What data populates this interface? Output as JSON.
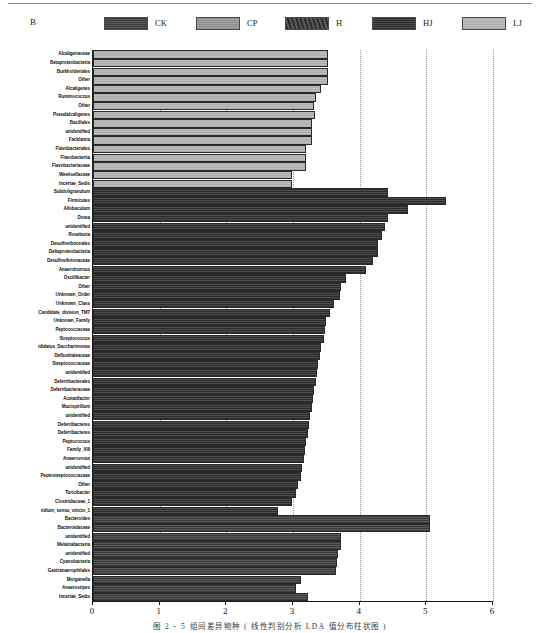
{
  "panel": {
    "label": "B"
  },
  "legend": {
    "items": [
      {
        "label": "CK",
        "group": "CK",
        "color": "#4a4a4a"
      },
      {
        "label": "CP",
        "group": "CP",
        "color": "#9a9a9a"
      },
      {
        "label": "H",
        "group": "H",
        "color": "#3a3a3a"
      },
      {
        "label": "HJ",
        "group": "HJ",
        "color": "#3c3c3c"
      },
      {
        "label": "LJ",
        "group": "LJ",
        "color": "#b5b5b5"
      }
    ]
  },
  "caption": {
    "text": "图 2 - 5    组间差异物种 ( 线性判别分析 LDA 值分布柱状图 )"
  },
  "chart_data": {
    "type": "bar",
    "orientation": "horizontal",
    "title": "",
    "xlabel": "",
    "ylabel": "",
    "xlim": [
      0,
      6
    ],
    "xticks": [
      0,
      1,
      2,
      3,
      4,
      5,
      6
    ],
    "grid": true,
    "legend_position": "top",
    "groups": [
      "CK",
      "CP",
      "H",
      "HJ",
      "LJ"
    ],
    "categories": [
      "Alcaligenaceae",
      "Betaproteobacteria",
      "Burkholderiales",
      "Other",
      "Alcaligenes",
      "Ruminococcus",
      "Other",
      "Pseudalcaligenes",
      "Bacillales",
      "unidentified",
      "Facklamia",
      "Flavobacteriales",
      "Flavobacteriia",
      "Flavobacteriaceae",
      "Weeksellaceae",
      "Incertae_Sedis",
      "Subdoligranulum",
      "Firmicutes",
      "Allobaculum",
      "Dorea",
      "unidentified",
      "Roseburia",
      "Desulfovibrionales",
      "Deltaproteobacteria",
      "Desulfovibrionaceae",
      "Anaerotruncus",
      "Oscillibacter",
      "Other",
      "Unknown_Order",
      "Unknown_Class",
      "Candidate_division_TM7",
      "Unknown_Family",
      "Peptococcaceae",
      "Streptococcus",
      "ididatus_Saccharimonas",
      "Defluviitaleaceae",
      "Streptococcaceae",
      "unidentified",
      "Deferribacterales",
      "Deferribacteraceae",
      "Acetatifactor",
      "Mucispirillum",
      "unidentified",
      "Deferribacteres",
      "Deferribacteres",
      "Peptococcus",
      "Family_XIII",
      "Anaerovorax",
      "unidentified",
      "Peptostreptococcaceae",
      "Other",
      "Turicibacter",
      "Clostridiaceae_1",
      "ridium_sensu_stricto_1",
      "Bacteroides",
      "Bacteroidaceae",
      "unidentified",
      "Melainabacteria",
      "unidentified",
      "Cyanobacteria",
      "Gastranaerophilales",
      "Morganella",
      "Anaerostipes",
      "Incertae_Sedis"
    ],
    "values": [
      3.52,
      3.52,
      3.52,
      3.53,
      3.42,
      3.35,
      3.32,
      3.33,
      3.28,
      3.28,
      3.28,
      3.2,
      3.2,
      3.2,
      2.98,
      2.98,
      4.42,
      5.3,
      4.72,
      4.42,
      4.38,
      4.34,
      4.28,
      4.28,
      4.2,
      4.1,
      3.8,
      3.72,
      3.7,
      3.62,
      3.56,
      3.5,
      3.48,
      3.46,
      3.42,
      3.4,
      3.38,
      3.36,
      3.34,
      3.32,
      3.3,
      3.28,
      3.26,
      3.24,
      3.22,
      3.2,
      3.18,
      3.16,
      3.14,
      3.12,
      3.08,
      3.04,
      2.98,
      2.78,
      5.05,
      5.05,
      3.72,
      3.72,
      3.68,
      3.66,
      3.64,
      3.12,
      3.05,
      3.22
    ],
    "series_group_of_row": [
      "LJ",
      "LJ",
      "LJ",
      "LJ",
      "LJ",
      "LJ",
      "LJ",
      "LJ",
      "LJ",
      "LJ",
      "LJ",
      "LJ",
      "LJ",
      "LJ",
      "LJ",
      "LJ",
      "HJ",
      "HJ",
      "HJ",
      "HJ",
      "HJ",
      "HJ",
      "HJ",
      "HJ",
      "HJ",
      "HJ",
      "HJ",
      "HJ",
      "HJ",
      "HJ",
      "HJ",
      "HJ",
      "HJ",
      "HJ",
      "HJ",
      "HJ",
      "HJ",
      "HJ",
      "HJ",
      "HJ",
      "HJ",
      "HJ",
      "HJ",
      "HJ",
      "HJ",
      "HJ",
      "HJ",
      "HJ",
      "HJ",
      "HJ",
      "HJ",
      "HJ",
      "HJ",
      "HJ",
      "CK",
      "CK",
      "CK",
      "CK",
      "CK",
      "CK",
      "CK",
      "CK",
      "CK",
      "CK"
    ]
  }
}
